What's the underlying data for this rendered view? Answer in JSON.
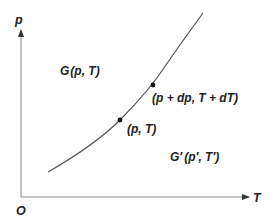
{
  "diagram": {
    "type": "phase-equilibrium-curve",
    "axes": {
      "y_label": "p",
      "x_label": "T",
      "origin_label": "O"
    },
    "regions": [
      {
        "id": "phase1",
        "label_func": "G",
        "label_args": "(p, T)",
        "prime": false
      },
      {
        "id": "phase2",
        "label_func": "G′",
        "label_args": "(p′, T′)",
        "prime": true
      }
    ],
    "points": [
      {
        "label": "(p, T)"
      },
      {
        "label": "(p + dp, T + dT)"
      }
    ],
    "colors": {
      "axis": "#888888",
      "curve": "#555555",
      "point": "#111111",
      "text": "#222222"
    }
  }
}
